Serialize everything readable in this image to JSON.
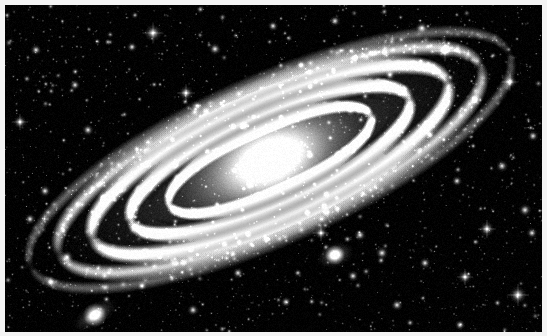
{
  "image": {
    "kind": "astrophotograph",
    "subject": "Andromeda Galaxy",
    "palette": "grayscale",
    "width": 547,
    "height": 336,
    "background_color": "#000000",
    "frame_color": "#f4f4f4",
    "frame_width": 5,
    "star_color": "#ffffff",
    "galaxy_glow_color": "#e8e8e8",
    "dust_lane_color": "#111111"
  },
  "sky": {
    "width": 537,
    "height": 327,
    "origin_x": 5,
    "origin_y": 5
  },
  "galaxy": {
    "name": "andromeda-galaxy",
    "type": "spiral",
    "center_x": 265,
    "center_y": 155,
    "semi_major": 262,
    "semi_minor": 78,
    "tilt_degrees": -24,
    "core_radius": 26,
    "core_brightness": 1.0,
    "arm_count": 5,
    "arms": [
      {
        "offset": 0.0,
        "radius_frac": 0.42,
        "thickness": 7,
        "brightness": 0.82
      },
      {
        "offset": 0.0,
        "radius_frac": 0.58,
        "thickness": 9,
        "brightness": 0.92
      },
      {
        "offset": 0.0,
        "radius_frac": 0.74,
        "thickness": 10,
        "brightness": 0.86
      },
      {
        "offset": 0.0,
        "radius_frac": 0.88,
        "thickness": 9,
        "brightness": 0.68
      },
      {
        "offset": 0.0,
        "radius_frac": 1.0,
        "thickness": 7,
        "brightness": 0.46
      }
    ],
    "dust_lanes": [
      {
        "radius_frac": 0.5,
        "thickness": 5,
        "opacity": 0.62
      },
      {
        "radius_frac": 0.66,
        "thickness": 6,
        "opacity": 0.58
      },
      {
        "radius_frac": 0.81,
        "thickness": 5,
        "opacity": 0.5
      }
    ],
    "knot_count": 900,
    "halo_opacity": 0.3
  },
  "companions": [
    {
      "name": "companion-galaxy-m32",
      "center_x": 330,
      "center_y": 250,
      "radius_x": 20,
      "radius_y": 13,
      "tilt_degrees": -18,
      "core_radius": 5,
      "brightness": 0.95
    },
    {
      "name": "companion-galaxy-m110",
      "center_x": 90,
      "center_y": 310,
      "radius_x": 26,
      "radius_y": 12,
      "tilt_degrees": -32,
      "core_radius": 6,
      "brightness": 0.88
    }
  ],
  "starfield": {
    "faint_star_count": 1450,
    "medium_star_count": 210,
    "bright_star_count": 46,
    "seed": 20240117,
    "bright_stars": [
      {
        "x": 148,
        "y": 28,
        "radius": 3.1
      },
      {
        "x": 210,
        "y": 44,
        "radius": 2.2
      },
      {
        "x": 127,
        "y": 42,
        "radius": 1.8
      },
      {
        "x": 31,
        "y": 45,
        "radius": 2.0
      },
      {
        "x": 181,
        "y": 88,
        "radius": 2.6
      },
      {
        "x": 15,
        "y": 117,
        "radius": 2.4
      },
      {
        "x": 83,
        "y": 125,
        "radius": 2.1
      },
      {
        "x": 268,
        "y": 21,
        "radius": 1.9
      },
      {
        "x": 330,
        "y": 16,
        "radius": 2.0
      },
      {
        "x": 417,
        "y": 23,
        "radius": 2.3
      },
      {
        "x": 440,
        "y": 46,
        "radius": 3.0
      },
      {
        "x": 470,
        "y": 95,
        "radius": 2.1
      },
      {
        "x": 505,
        "y": 77,
        "radius": 2.5
      },
      {
        "x": 528,
        "y": 131,
        "radius": 2.0
      },
      {
        "x": 497,
        "y": 161,
        "radius": 2.2
      },
      {
        "x": 452,
        "y": 176,
        "radius": 1.9
      },
      {
        "x": 520,
        "y": 205,
        "radius": 2.3
      },
      {
        "x": 527,
        "y": 228,
        "radius": 2.0
      },
      {
        "x": 482,
        "y": 224,
        "radius": 2.7
      },
      {
        "x": 513,
        "y": 290,
        "radius": 3.2
      },
      {
        "x": 460,
        "y": 272,
        "radius": 2.4
      },
      {
        "x": 420,
        "y": 258,
        "radius": 2.0
      },
      {
        "x": 392,
        "y": 300,
        "radius": 2.1
      },
      {
        "x": 355,
        "y": 230,
        "radius": 2.2
      },
      {
        "x": 316,
        "y": 228,
        "radius": 2.4
      },
      {
        "x": 377,
        "y": 248,
        "radius": 2.3
      },
      {
        "x": 348,
        "y": 271,
        "radius": 2.0
      },
      {
        "x": 281,
        "y": 297,
        "radius": 1.9
      },
      {
        "x": 233,
        "y": 268,
        "radius": 2.0
      },
      {
        "x": 188,
        "y": 305,
        "radius": 2.1
      },
      {
        "x": 137,
        "y": 281,
        "radius": 1.8
      },
      {
        "x": 62,
        "y": 252,
        "radius": 2.3
      },
      {
        "x": 46,
        "y": 277,
        "radius": 2.2
      },
      {
        "x": 25,
        "y": 214,
        "radius": 2.0
      },
      {
        "x": 40,
        "y": 186,
        "radius": 2.1
      },
      {
        "x": 98,
        "y": 192,
        "radius": 1.9
      },
      {
        "x": 239,
        "y": 121,
        "radius": 1.8
      },
      {
        "x": 296,
        "y": 60,
        "radius": 1.7
      },
      {
        "x": 385,
        "y": 70,
        "radius": 1.9
      },
      {
        "x": 212,
        "y": 205,
        "radius": 1.8
      },
      {
        "x": 170,
        "y": 160,
        "radius": 1.7
      },
      {
        "x": 425,
        "y": 130,
        "radius": 1.8
      },
      {
        "x": 70,
        "y": 80,
        "radius": 1.9
      },
      {
        "x": 245,
        "y": 180,
        "radius": 1.7
      },
      {
        "x": 305,
        "y": 150,
        "radius": 1.6
      },
      {
        "x": 455,
        "y": 320,
        "radius": 1.9
      }
    ]
  }
}
